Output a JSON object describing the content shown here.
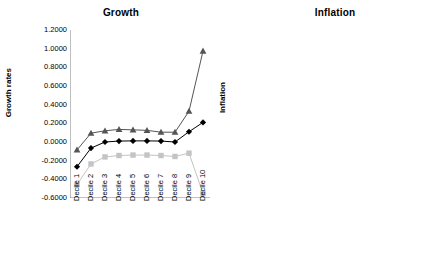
{
  "figure": {
    "background": "#ffffff",
    "panels": [
      "growth",
      "inflation"
    ]
  },
  "chart_data": [
    {
      "id": "growth",
      "type": "line",
      "title": "Growth",
      "xlabel": "",
      "ylabel": "Growth rates",
      "categories": [
        "Decile 1",
        "Decile 2",
        "Decile 3",
        "Decile 4",
        "Decile 5",
        "Decile 6",
        "Decile 7",
        "Decile 8",
        "Decile 9",
        "Decile 10"
      ],
      "ylim": [
        -0.6,
        1.2
      ],
      "ytick_labels": [
        "1.2000",
        "1.0000",
        "0.8000",
        "0.6000",
        "0.4000",
        "0.2000",
        "0.0000",
        "-0.2000",
        "-0.4000",
        "-0.6000"
      ],
      "ytick_values": [
        1.2,
        1.0,
        0.8,
        0.6,
        0.4,
        0.2,
        0.0,
        -0.2,
        -0.4,
        -0.6
      ],
      "grid": false,
      "legend": "none",
      "series": [
        {
          "name": "upper",
          "marker": "triangle",
          "color": "#555555",
          "values": [
            -0.085,
            0.095,
            0.12,
            0.135,
            0.13,
            0.125,
            0.105,
            0.105,
            0.33,
            0.975
          ]
        },
        {
          "name": "middle",
          "marker": "diamond",
          "color": "#000000",
          "values": [
            -0.265,
            -0.065,
            0.0,
            0.01,
            0.012,
            0.012,
            0.01,
            0.0,
            0.11,
            0.21
          ]
        },
        {
          "name": "lower",
          "marker": "square",
          "color": "#c4c4c4",
          "values": [
            -0.455,
            -0.235,
            -0.16,
            -0.145,
            -0.14,
            -0.14,
            -0.145,
            -0.155,
            -0.12,
            -0.55
          ]
        }
      ]
    },
    {
      "id": "inflation",
      "type": "line",
      "title": "Inflation",
      "xlabel": "",
      "ylabel": "Inflation",
      "categories": [
        "Decile 1",
        "Decile 2",
        "Decile 3",
        "Decile 4",
        "Decile 5",
        "Decile 6",
        "Decile 7",
        "Decile 8",
        "Decile 9",
        "Decile 10"
      ],
      "ylim": [
        -0.04,
        0.12
      ],
      "ytick_labels": [
        "0.1200",
        "0.1000",
        "0.0800",
        "0.0600",
        "0.0400",
        "0.0200",
        "0.0000",
        "-0.0200",
        "-0.0400"
      ],
      "ytick_values": [
        0.12,
        0.1,
        0.08,
        0.06,
        0.04,
        0.02,
        0.0,
        -0.02,
        -0.04
      ],
      "grid": false,
      "legend": "none",
      "series": [
        {
          "name": "upper",
          "marker": "triangle",
          "color": "#555555",
          "values": [
            -0.0095,
            -0.009,
            -0.0075,
            -0.0055,
            -0.004,
            -0.002,
            0.0005,
            0.004,
            0.0345,
            0.0955
          ]
        },
        {
          "name": "middle",
          "marker": "diamond",
          "color": "#000000",
          "values": [
            -0.0205,
            -0.0195,
            -0.018,
            -0.016,
            -0.0135,
            -0.0105,
            -0.007,
            -0.0015,
            0.0215,
            0.0515
          ]
        },
        {
          "name": "lower",
          "marker": "square",
          "color": "#c4c4c4",
          "values": [
            -0.0305,
            -0.029,
            -0.0275,
            -0.0255,
            -0.0225,
            -0.019,
            -0.0145,
            -0.0065,
            0.008,
            0.0115
          ]
        }
      ]
    }
  ]
}
